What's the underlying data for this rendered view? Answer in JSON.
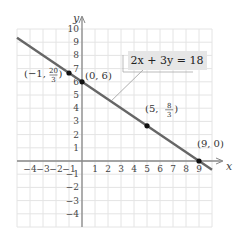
{
  "chart_data": {
    "type": "line",
    "title": "",
    "xlabel": "x",
    "ylabel": "y",
    "xlim": [
      -5,
      10
    ],
    "ylim": [
      -5,
      10
    ],
    "grid": true,
    "x_ticks": [
      -4,
      -3,
      -2,
      -1,
      1,
      2,
      3,
      4,
      5,
      6,
      7,
      8,
      9
    ],
    "y_ticks": [
      -4,
      -3,
      -2,
      -1,
      1,
      2,
      3,
      4,
      5,
      6,
      7,
      8,
      9,
      10
    ],
    "series": [
      {
        "name": "2x + 3y = 18",
        "equation": "2x + 3y = 18",
        "line": {
          "x": [
            -5,
            10
          ],
          "y": [
            9.333,
            -0.667
          ]
        },
        "color": "#666666"
      }
    ],
    "points": [
      {
        "x": -1,
        "y": 6.667,
        "label_left": "(−1, ",
        "num": "20",
        "den": "3",
        "label_right": ")"
      },
      {
        "x": 0,
        "y": 6,
        "label": "(0, 6)"
      },
      {
        "x": 5,
        "y": 2.667,
        "label_left": "(5, ",
        "num": "8",
        "den": "3",
        "label_right": ")"
      },
      {
        "x": 9,
        "y": 0,
        "label": "(9, 0)"
      }
    ],
    "annotation": {
      "text": "2x + 3y = 18",
      "box_color": "#e6e6e6"
    }
  },
  "colors": {
    "grid": "#e4e4e4",
    "axis": "#888888",
    "line": "#666666",
    "point": "#111111"
  }
}
